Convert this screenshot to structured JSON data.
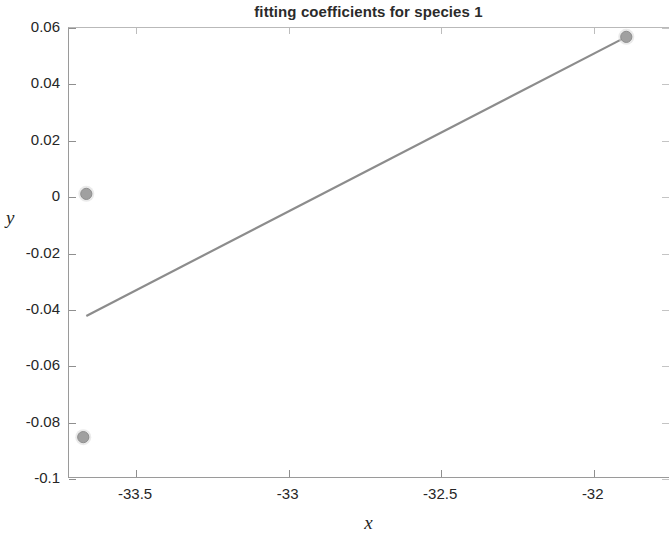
{
  "chart_data": {
    "type": "scatter",
    "title": "fitting coefficients for species 1",
    "xlabel": "x",
    "ylabel": "y",
    "xlim": [
      -33.72,
      -31.75
    ],
    "ylim": [
      -0.1,
      0.06
    ],
    "xticks": [
      -33.5,
      -33,
      -32.5,
      -32
    ],
    "xtick_labels": [
      "-33.5",
      "-33",
      "-32.5",
      "-32"
    ],
    "yticks": [
      0.06,
      0.04,
      0.02,
      0,
      -0.02,
      -0.04,
      -0.06,
      -0.08,
      -0.1
    ],
    "ytick_labels": [
      "0.06",
      "0.04",
      "0.02",
      "0",
      "-0.02",
      "-0.04",
      "-0.06",
      "-0.08",
      "-0.1"
    ],
    "grid": false,
    "legend": null,
    "marker_color": "#a0a0a0",
    "line_color": "#8c8c8c",
    "series": [
      {
        "name": "data points",
        "type": "scatter",
        "marker": "circle",
        "points": [
          {
            "x": -33.66,
            "y": 0.0008
          },
          {
            "x": -33.67,
            "y": -0.0855
          },
          {
            "x": -31.89,
            "y": 0.0565
          }
        ]
      },
      {
        "name": "fit line",
        "type": "line",
        "points": [
          {
            "x": -33.66,
            "y": -0.0425
          },
          {
            "x": -31.89,
            "y": 0.0565
          }
        ]
      }
    ]
  },
  "figure": {
    "background": "#ffffff",
    "axis_color": "#8f8f8f",
    "text_color": "#262626"
  }
}
